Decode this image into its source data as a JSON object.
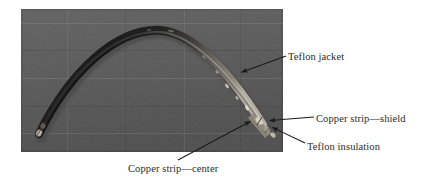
{
  "figure": {
    "kind": "annotated-photograph",
    "photo": {
      "background_color": "#5a5a5a",
      "cable_color": "#1e1e1e",
      "highlight_color": "#cfc9bd"
    },
    "callouts": [
      {
        "id": "teflon-jacket",
        "text": "Teflon jacket",
        "arrow_from": [
          286,
          56
        ],
        "arrow_to": [
          240,
          73
        ]
      },
      {
        "id": "copper-strip-shield",
        "text": "Copper strip—shield",
        "arrow_from": [
          314,
          117
        ],
        "arrow_to": [
          268,
          121
        ]
      },
      {
        "id": "teflon-insulation",
        "text": "Teflon insulation",
        "arrow_from": [
          305,
          143
        ],
        "arrow_to": [
          271,
          128
        ]
      },
      {
        "id": "copper-strip-center",
        "text": "Copper strip—center",
        "arrow_from": [
          178,
          160
        ],
        "arrow_to": [
          252,
          120
        ]
      }
    ]
  }
}
